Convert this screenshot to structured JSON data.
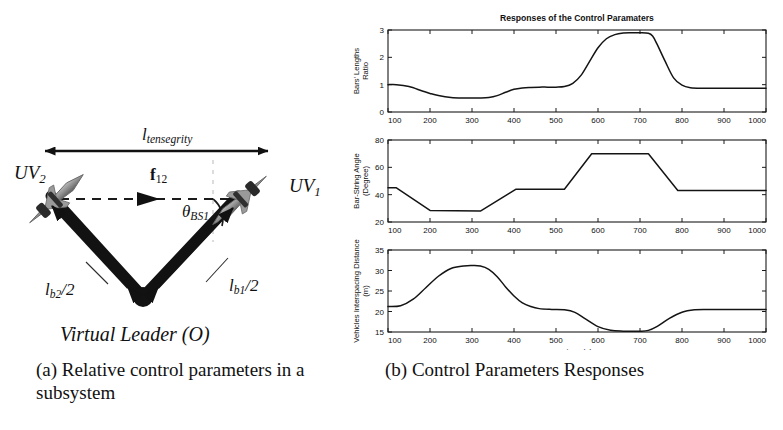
{
  "figure": {
    "panel_a": {
      "caption": "(a) Relative control parameters in a subsystem",
      "labels": {
        "tensegrity_length": "l",
        "tensegrity_length_sub": "tensegrity",
        "uv2": "UV",
        "uv2_sub": "2",
        "uv1": "UV",
        "uv1_sub": "1",
        "force": "f",
        "force_sub": "12",
        "angle": "θ",
        "angle_sub": "BS1",
        "bar2": "l",
        "bar2_sub": "b2",
        "bar2_tail": "/2",
        "bar1": "l",
        "bar1_sub": "b1",
        "bar1_tail": "/2",
        "virtual_leader": "Virtual Leader (O)"
      },
      "colors": {
        "bar": "#111111",
        "vehicle": "#8a8a8a",
        "arrow": "#1a1a1a",
        "dashed": "#222222"
      }
    },
    "panel_b": {
      "caption": "(b) Control Parameters Responses"
    }
  },
  "chart_data": [
    {
      "type": "line",
      "title": "Responses of the Control Paramaters",
      "xlabel": "",
      "ylabel": "Bars' Lengths Ratio",
      "xlim": [
        100,
        1000
      ],
      "ylim": [
        0,
        3
      ],
      "xticks": [
        100,
        200,
        300,
        400,
        500,
        600,
        700,
        800,
        900,
        1000
      ],
      "yticks": [
        0,
        1,
        2,
        3
      ],
      "xticklabels": [
        "100",
        "200",
        "300",
        "400",
        "500",
        "600",
        "700",
        "800",
        "900",
        "1000"
      ],
      "yticklabels": [
        "0",
        "1",
        "2",
        "3"
      ],
      "grid": false,
      "legend": "none",
      "x": [
        100,
        120,
        150,
        180,
        200,
        220,
        250,
        280,
        300,
        320,
        340,
        360,
        380,
        400,
        420,
        440,
        460,
        480,
        500,
        520,
        540,
        560,
        580,
        600,
        620,
        640,
        660,
        680,
        700,
        720,
        730,
        740,
        760,
        780,
        800,
        820,
        850,
        900,
        950,
        1000
      ],
      "y": [
        1.0,
        1.0,
        0.93,
        0.78,
        0.68,
        0.6,
        0.53,
        0.51,
        0.51,
        0.51,
        0.53,
        0.6,
        0.72,
        0.83,
        0.88,
        0.9,
        0.91,
        0.91,
        0.91,
        0.93,
        1.05,
        1.35,
        1.85,
        2.35,
        2.68,
        2.83,
        2.89,
        2.9,
        2.9,
        2.88,
        2.78,
        2.5,
        1.85,
        1.25,
        0.98,
        0.89,
        0.87,
        0.87,
        0.87,
        0.87
      ]
    },
    {
      "type": "line",
      "title": "",
      "xlabel": "",
      "ylabel": "Bar-String Angle (Degree)",
      "xlim": [
        100,
        1000
      ],
      "ylim": [
        20,
        80
      ],
      "xticks": [
        100,
        200,
        300,
        400,
        500,
        600,
        700,
        800,
        900,
        1000
      ],
      "yticks": [
        20,
        40,
        60,
        80
      ],
      "xticklabels": [
        "100",
        "200",
        "300",
        "400",
        "500",
        "600",
        "700",
        "800",
        "900",
        "1000"
      ],
      "yticklabels": [
        "20",
        "40",
        "60",
        "80"
      ],
      "grid": false,
      "legend": "none",
      "x": [
        100,
        120,
        200,
        320,
        405,
        520,
        585,
        720,
        790,
        1000
      ],
      "y": [
        45,
        45,
        28.5,
        28,
        44,
        44,
        70,
        70,
        43,
        43
      ]
    },
    {
      "type": "line",
      "title": "",
      "xlabel": "Time (s)",
      "ylabel": "Vehicles Interspacing Distance (m)",
      "xlim": [
        100,
        1000
      ],
      "ylim": [
        15,
        35
      ],
      "xticks": [
        100,
        200,
        300,
        400,
        500,
        600,
        700,
        800,
        900,
        1000
      ],
      "yticks": [
        15,
        20,
        25,
        30,
        35
      ],
      "xticklabels": [
        "100",
        "200",
        "300",
        "400",
        "500",
        "600",
        "700",
        "800",
        "900",
        "1000"
      ],
      "yticklabels": [
        "15",
        "20",
        "25",
        "30",
        "35"
      ],
      "grid": false,
      "legend": "none",
      "x": [
        100,
        130,
        160,
        190,
        220,
        250,
        280,
        300,
        320,
        340,
        360,
        380,
        400,
        420,
        440,
        460,
        490,
        520,
        545,
        570,
        600,
        630,
        660,
        700,
        720,
        740,
        770,
        800,
        830,
        860,
        900,
        950,
        1000
      ],
      "y": [
        21.2,
        21.4,
        23.0,
        25.8,
        28.6,
        30.5,
        31.1,
        31.2,
        31.1,
        30.3,
        28.5,
        26.0,
        23.8,
        22.1,
        21.2,
        20.7,
        20.5,
        20.4,
        19.8,
        18.2,
        16.3,
        15.4,
        15.2,
        15.2,
        15.4,
        16.3,
        18.3,
        19.8,
        20.4,
        20.5,
        20.5,
        20.5,
        20.5
      ]
    }
  ]
}
